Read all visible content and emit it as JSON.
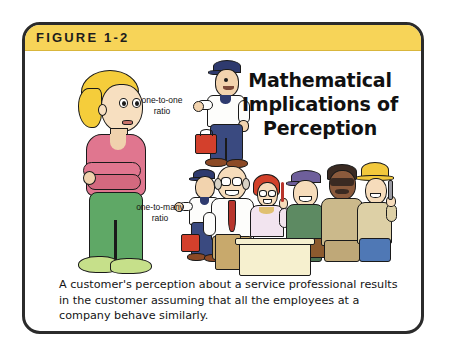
{
  "figure": {
    "label": "FIGURE 1-2",
    "banner_color": "#f7d458",
    "border_color": "#2b2b2b",
    "background_color": "#ffffff"
  },
  "headline": {
    "line1": "Mathematical",
    "line2": "Implications of",
    "line3": "Perception",
    "full": "Mathematical Implications of Perception"
  },
  "callouts": {
    "one_to_one": "one-to-one\nratio",
    "one_to_many": "one-to-many\nratio"
  },
  "caption": {
    "text": "A customer's perception about a service professional results in the customer assuming that all the employees at a company behave similarly."
  },
  "illustration": {
    "customer": {
      "name": "customer-figure",
      "hair_color": "#f5cd3b",
      "shirt_color": "#e0768f",
      "pants_color": "#5fa866",
      "shoe_color": "#c6e08a",
      "skin_color": "#f7dfc0",
      "pose": "arms-crossed"
    },
    "service_professional": {
      "name": "service-professional-figure",
      "cap_color": "#2e3a6e",
      "shirt_color": "#fdfdfb",
      "pants_color": "#3a4a80",
      "toolbox_color": "#d3402c",
      "shoe_color": "#8c4a26"
    },
    "employee_group": {
      "name": "employee-group",
      "count": 6,
      "members": [
        {
          "name": "employee-technician",
          "top_color": "#fdfdfb",
          "bottom_color": "#3a4a80",
          "headwear": "navy-cap"
        },
        {
          "name": "employee-manager",
          "top_color": "#fdfdfb",
          "bottom_color": "#c8a96c",
          "accent_color": "#b8352c",
          "headwear": "bald-glasses"
        },
        {
          "name": "employee-receptionist",
          "top_color": "#f2e4ef",
          "hair_color": "#d2412a",
          "headwear": "red-hair-glasses"
        },
        {
          "name": "employee-supervisor",
          "top_color": "#5d8a62",
          "bottom_color": "#4c7352",
          "headwear": "purple-cap"
        },
        {
          "name": "employee-field-agent",
          "top_color": "#cbb98b",
          "bottom_color": "#bfa878",
          "headwear": "sunglasses"
        },
        {
          "name": "employee-construction-worker",
          "top_color": "#ddd0a6",
          "bottom_color": "#4f78b5",
          "headwear": "yellow-hard-hat",
          "prop": "wrench"
        }
      ],
      "desk_color": "#f6f0cf"
    }
  }
}
